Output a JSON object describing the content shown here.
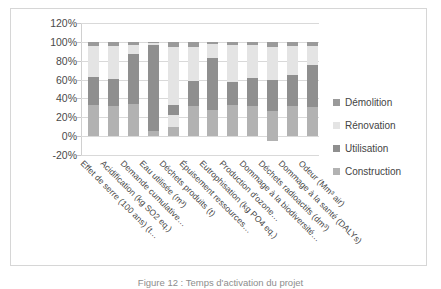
{
  "chart_data": {
    "type": "bar",
    "title": "",
    "subtitle": "",
    "xlabel": "",
    "ylabel": "",
    "stacked": true,
    "stack_mode": "percent",
    "orientation": "vertical",
    "grid": true,
    "legend_position": "right",
    "ylim": [
      -20,
      120
    ],
    "ytick_labels": [
      "120%",
      "100%",
      "80%",
      "60%",
      "40%",
      "20%",
      "0%",
      "-20%"
    ],
    "ytick_values": [
      120,
      100,
      80,
      60,
      40,
      20,
      0,
      -20
    ],
    "categories": [
      "Effet de serre (100 ans) (t…",
      "Acidification (kg SO2 eq.)",
      "Demande cumulative…",
      "Eau utilisée (m³)",
      "Déchets produits (t)",
      "Épuisement ressources…",
      "Eutrophisation (kg PO4 eq.)",
      "Production d'ozone…",
      "Dommage à la biodiversité…",
      "Déchets radioactifs (dm³)",
      "Dommage à la santé (DALYs)",
      "Odeur (Mm³ air)"
    ],
    "series": [
      {
        "name": "Construction",
        "color": "#b2b2b2",
        "values": [
          33,
          32,
          34,
          5,
          17,
          32,
          28,
          33,
          32,
          32,
          32,
          31
        ]
      },
      {
        "name": "Utilisation",
        "color": "#8f8f8f",
        "values": [
          30,
          29,
          53,
          92,
          16,
          26,
          55,
          24,
          30,
          33,
          33,
          44
        ]
      },
      {
        "name": "Rénovation",
        "color": "#e4e4e4",
        "values": [
          33,
          35,
          10,
          2,
          62,
          37,
          15,
          40,
          35,
          35,
          31,
          21
        ]
      },
      {
        "name": "Démolition",
        "color": "#9a9a9a",
        "values": [
          4,
          4,
          3,
          1,
          5,
          5,
          2,
          3,
          3,
          5,
          4,
          4
        ]
      }
    ],
    "notes": [
      "Déchets produits (t) contains a light band between approximately 10% and 22%.",
      "Déchets radioactifs (dm³) extends below 0% to about -5% and above 100% to about 105%."
    ]
  },
  "legend": {
    "items": [
      {
        "label": "Démolition",
        "color": "#9a9a9a"
      },
      {
        "label": "Rénovation",
        "color": "#e4e4e4"
      },
      {
        "label": "Utilisation",
        "color": "#8f8f8f"
      },
      {
        "label": "Construction",
        "color": "#b2b2b2"
      }
    ]
  },
  "caption": {
    "text": "Figure 12 : Temps d'activation du projet"
  }
}
